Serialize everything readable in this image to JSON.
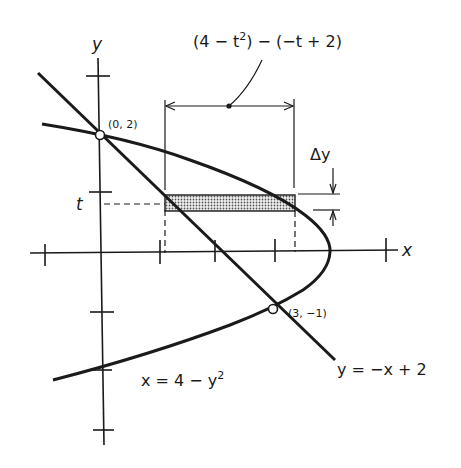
{
  "diagram": {
    "type": "region-between-curves",
    "axes": {
      "x_label": "x",
      "y_label": "y"
    },
    "curves": [
      {
        "name": "parabola",
        "equation": "x = 4 - y^2",
        "label_x": "x = 4 − y",
        "label_exp": "2"
      },
      {
        "name": "line",
        "equation": "y = -x + 2",
        "label": "y = −x + 2"
      }
    ],
    "intersection_points": [
      {
        "label": "(0, 2)",
        "x": 0,
        "y": 2
      },
      {
        "label": "(3, −1)",
        "x": 3,
        "y": -1
      }
    ],
    "strip": {
      "height_label": "Δy",
      "level_label": "t",
      "width_expression": {
        "part1": "(4 − t",
        "sup1": "2",
        "part2": ") − (−t + 2)"
      }
    },
    "ticks": {
      "x": [
        -1,
        1,
        2,
        3,
        5
      ],
      "y": [
        3,
        1,
        -1,
        -2,
        -3
      ]
    },
    "colors": {
      "ink": "#1a1a1a",
      "strip_fill": "#c8c8c8"
    }
  }
}
